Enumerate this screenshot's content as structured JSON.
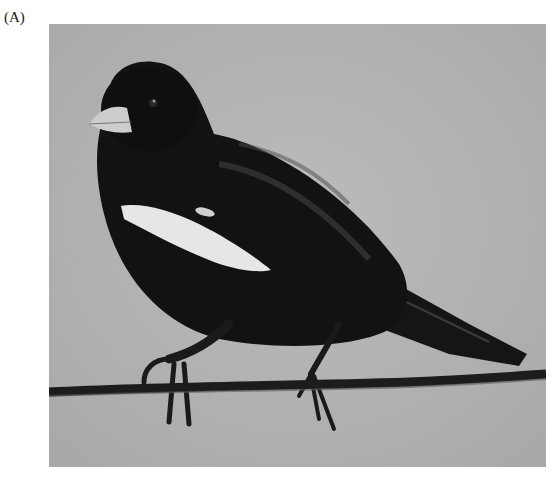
{
  "figure": {
    "panel_label": "(A)",
    "photo": {
      "subject": "black bird with white shoulder patch perched on barbed wire",
      "background_color": "#b3b3b3",
      "bird_color": "#111111",
      "patch_color": "#e8e8e8",
      "beak_color": "#cfcfcf",
      "wire_color": "#1c1c1c"
    }
  }
}
